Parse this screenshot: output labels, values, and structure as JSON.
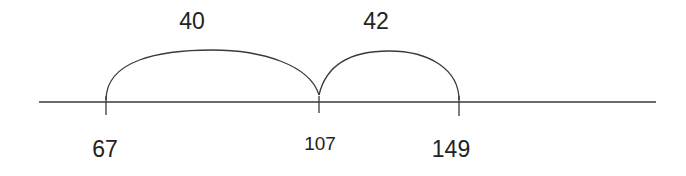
{
  "diagram": {
    "type": "open-number-line",
    "line_color": "#3a3a3a",
    "text_color": "#222222",
    "points": [
      {
        "value": "67",
        "x": 106
      },
      {
        "value": "107",
        "x": 319
      },
      {
        "value": "149",
        "x": 459
      }
    ],
    "jumps": [
      {
        "label": "40",
        "from": "67",
        "to": "107"
      },
      {
        "label": "42",
        "from": "107",
        "to": "149"
      }
    ]
  }
}
